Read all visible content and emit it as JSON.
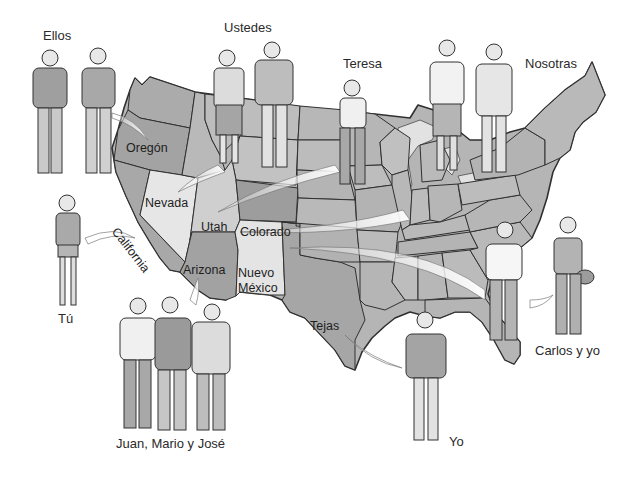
{
  "colors": {
    "background": "#ffffff",
    "state_dark": "#a6a6a6",
    "state_mid": "#b8b8b8",
    "state_light": "#d9d9d9",
    "state_lightest": "#e8e8e8",
    "outline": "#3a3a3a",
    "swoosh": "#f2f2f2"
  },
  "people_labels": {
    "ellos": "Ellos",
    "ustedes": "Ustedes",
    "teresa": "Teresa",
    "nosotras": "Nosotras",
    "tu": "Tú",
    "juan_mario_jose": "Juan, Mario y José",
    "yo": "Yo",
    "carlos_y_yo": "Carlos y yo"
  },
  "state_labels": {
    "oregon": "Oregón",
    "nevada": "Nevada",
    "california": "California",
    "utah": "Utah",
    "colorado": "Colorado",
    "arizona": "Arizona",
    "nuevo_mexico_line1": "Nuevo",
    "nuevo_mexico_line2": "México",
    "tejas": "Tejas"
  }
}
